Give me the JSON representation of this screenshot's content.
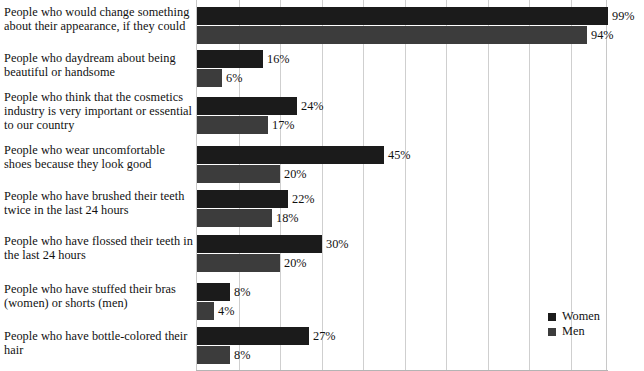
{
  "chart_data": {
    "type": "bar",
    "orientation": "horizontal",
    "title": "",
    "subtitle": "",
    "xlabel": "",
    "ylabel": "",
    "xlim": [
      0,
      99
    ],
    "grid": true,
    "gridline_interval_percent": 10,
    "legend_position": "bottom-right",
    "value_suffix": "%",
    "categories": [
      "People who would change something about their appearance, if they could",
      "People who daydream about being beautiful or handsome",
      "People who think that the cosmetics industry is very important or essential to our country",
      "People who wear uncomfortable shoes because they look good",
      "People who have brushed their teeth twice in the last 24 hours",
      "People who have flossed their teeth in the last 24 hours",
      "People who have stuffed their bras (women) or shorts (men)",
      "People who have bottle-colored their hair"
    ],
    "series": [
      {
        "name": "Women",
        "color": "#1b1b1b",
        "values": [
          99,
          16,
          24,
          45,
          22,
          30,
          8,
          27
        ],
        "labels": [
          "99%",
          "16%",
          "24%",
          "45%",
          "22%",
          "30%",
          "8%",
          "27%"
        ]
      },
      {
        "name": "Men",
        "color": "#3c3c3c",
        "values": [
          94,
          6,
          17,
          20,
          18,
          20,
          4,
          8
        ],
        "labels": [
          "94%",
          "6%",
          "17%",
          "20%",
          "18%",
          "20%",
          "4%",
          "8%"
        ]
      }
    ]
  },
  "legend": {
    "items": [
      {
        "label": "Women",
        "color": "#1b1b1b"
      },
      {
        "label": "Men",
        "color": "#3c3c3c"
      }
    ]
  }
}
